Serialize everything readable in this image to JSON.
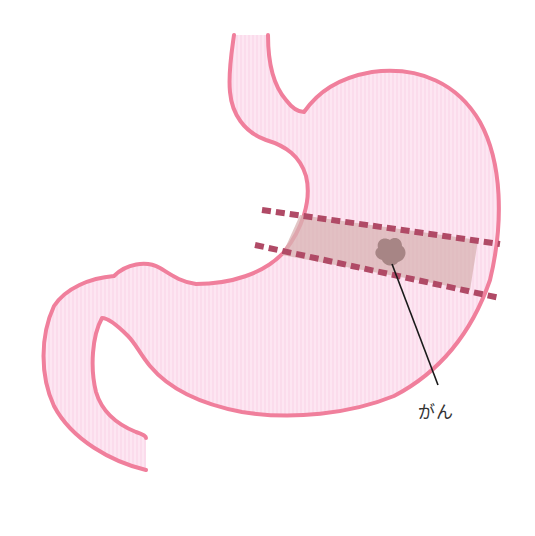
{
  "diagram": {
    "labels": {
      "tumor": "がん"
    },
    "colors": {
      "outline": "#f07f9c",
      "fill": "#fde6f2",
      "fill_stripe": "#f9d2e6",
      "resection_band": "#d8b3b3",
      "cut_line": "#b04a66",
      "tumor": "#a78585",
      "leader_line": "#1a1a1a",
      "label_text": "#333333"
    },
    "elements": [
      {
        "name": "esophagus",
        "description": "tube entering stomach at top"
      },
      {
        "name": "stomach-body",
        "description": "pink J-shaped stomach outline"
      },
      {
        "name": "duodenum",
        "description": "curved tube exiting at lower left"
      },
      {
        "name": "resection-band",
        "description": "shaded band between two dashed cut lines"
      },
      {
        "name": "upper-cut-line",
        "description": "dashed line across the stomach"
      },
      {
        "name": "lower-cut-line",
        "description": "dashed line across the stomach"
      },
      {
        "name": "tumor",
        "description": "gray-brown lesion within band"
      },
      {
        "name": "leader-line",
        "description": "line from tumor to label"
      }
    ]
  }
}
